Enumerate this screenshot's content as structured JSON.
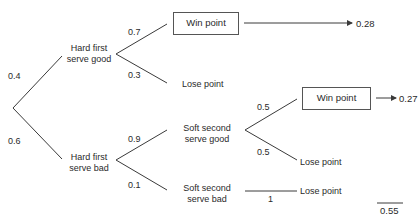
{
  "tree": {
    "root_branches": [
      {
        "prob": "0.4",
        "node": {
          "line1": "Hard first",
          "line2": "serve good"
        }
      },
      {
        "prob": "0.6",
        "node": {
          "line1": "Hard first",
          "line2": "serve bad"
        }
      }
    ],
    "good_first": {
      "win": {
        "prob": "0.7",
        "label": "Win point",
        "result": "0.28"
      },
      "lose": {
        "prob": "0.3",
        "label": "Lose point"
      }
    },
    "bad_first": {
      "soft_good": {
        "prob": "0.9",
        "line1": "Soft second",
        "line2": "serve good"
      },
      "soft_bad": {
        "prob": "0.1",
        "line1": "Soft second",
        "line2": "serve bad"
      }
    },
    "soft_good": {
      "win": {
        "prob": "0.5",
        "label": "Win point",
        "result": "0.27"
      },
      "lose": {
        "prob": "0.5",
        "label": "Lose point"
      }
    },
    "soft_bad": {
      "lose": {
        "prob": "1",
        "label": "Lose point"
      }
    },
    "total": "0.55"
  },
  "colors": {
    "line": "#3a3a3a",
    "text": "#2a2a2a",
    "box_border": "#555555"
  }
}
